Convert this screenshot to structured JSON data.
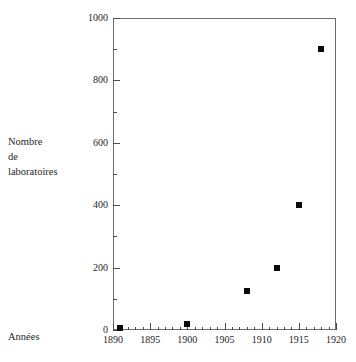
{
  "figure": {
    "background_color": "#ffffff",
    "axis_color": "#6b6b6b",
    "marker_color": "#0a0a0a"
  },
  "labels": {
    "y_caption_line1": "Nombre",
    "y_caption_line2": "de",
    "y_caption_line3": "laboratoires",
    "x_caption": "Années"
  },
  "chart_data": {
    "type": "scatter",
    "title": "",
    "xlabel": "Années",
    "ylabel": "Nombre de laboratoires",
    "xlim": [
      1890,
      1920
    ],
    "ylim": [
      0,
      1000
    ],
    "grid": false,
    "legend": "none",
    "marker_style": "filled-square",
    "x_ticks": [
      1890,
      1895,
      1900,
      1905,
      1910,
      1915,
      1920
    ],
    "x_tick_labels": [
      "1890",
      "1895",
      "1900",
      "1905",
      "1910",
      "1915",
      "1920"
    ],
    "x_minor_tick_interval": 1,
    "y_ticks": [
      0,
      200,
      400,
      600,
      800,
      1000
    ],
    "y_tick_labels": [
      "0",
      "200",
      "400",
      "600",
      "800",
      "1000"
    ],
    "y_minor_tick_interval": 50,
    "points": [
      {
        "x": 1891,
        "y": 5
      },
      {
        "x": 1900,
        "y": 20
      },
      {
        "x": 1908,
        "y": 125
      },
      {
        "x": 1912,
        "y": 200
      },
      {
        "x": 1915,
        "y": 400
      },
      {
        "x": 1918,
        "y": 900
      }
    ]
  }
}
